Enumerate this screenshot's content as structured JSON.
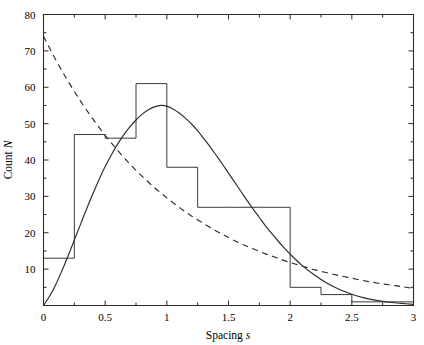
{
  "chart_data": {
    "type": "bar",
    "title": "",
    "xlabel": "Spacing s",
    "ylabel": "Count N",
    "xlim": [
      0,
      3
    ],
    "ylim": [
      0,
      80
    ],
    "grid": false,
    "legend": "none",
    "bin_width": 0.25,
    "bin_edges": [
      0,
      0.25,
      0.5,
      0.75,
      1,
      1.25,
      1.5,
      1.75,
      2,
      2.25,
      2.5,
      2.75,
      3
    ],
    "categories": [
      "0-0.25",
      "0.25-0.5",
      "0.5-0.75",
      "0.75-1",
      "1-1.25",
      "1.25-1.5",
      "1.5-1.75",
      "1.75-2",
      "2-2.25",
      "2.25-2.5",
      "2.5-2.75",
      "2.75-3"
    ],
    "values": [
      13,
      47,
      46,
      61,
      38,
      27,
      27,
      27,
      5,
      3,
      1,
      1
    ],
    "x_tick_values": [
      0,
      0.5,
      1,
      1.5,
      2,
      2.5,
      3
    ],
    "x_tick_labels": [
      "0",
      "0.5",
      "1",
      "1.5",
      "2",
      "2.5",
      "3"
    ],
    "x_minor_tick_values": [
      0.25,
      0.75,
      1.25,
      1.75,
      2.25,
      2.75
    ],
    "y_tick_values": [
      0,
      10,
      20,
      30,
      40,
      50,
      60,
      70,
      80
    ],
    "y_tick_labels": [
      "0",
      "10",
      "20",
      "30",
      "40",
      "50",
      "60",
      "70",
      "80"
    ],
    "series": [
      {
        "name": "wigner-surmise-curve",
        "style": "solid",
        "type": "line",
        "description": "Wigner surmise fit, rises from origin, peaks near s=0.85 at N=57.5, decays toward zero by s=3",
        "points": [
          [
            0.0,
            0.0
          ],
          [
            0.05,
            2.6
          ],
          [
            0.1,
            5.8
          ],
          [
            0.15,
            9.6
          ],
          [
            0.2,
            13.7
          ],
          [
            0.25,
            18.0
          ],
          [
            0.3,
            22.3
          ],
          [
            0.35,
            26.6
          ],
          [
            0.4,
            30.7
          ],
          [
            0.45,
            34.6
          ],
          [
            0.5,
            38.2
          ],
          [
            0.55,
            41.4
          ],
          [
            0.6,
            44.3
          ],
          [
            0.65,
            46.9
          ],
          [
            0.7,
            49.1
          ],
          [
            0.75,
            51.0
          ],
          [
            0.8,
            52.6
          ],
          [
            0.85,
            53.8
          ],
          [
            0.9,
            54.6
          ],
          [
            0.95,
            55.0
          ],
          [
            1.0,
            54.8
          ],
          [
            1.05,
            54.0
          ],
          [
            1.1,
            52.9
          ],
          [
            1.15,
            51.5
          ],
          [
            1.2,
            49.9
          ],
          [
            1.25,
            48.0
          ],
          [
            1.3,
            45.9
          ],
          [
            1.35,
            43.7
          ],
          [
            1.4,
            41.3
          ],
          [
            1.45,
            38.9
          ],
          [
            1.5,
            36.4
          ],
          [
            1.55,
            33.9
          ],
          [
            1.6,
            31.4
          ],
          [
            1.65,
            28.9
          ],
          [
            1.7,
            26.5
          ],
          [
            1.75,
            24.2
          ],
          [
            1.8,
            21.9
          ],
          [
            1.85,
            19.8
          ],
          [
            1.9,
            17.8
          ],
          [
            1.95,
            15.9
          ],
          [
            2.0,
            14.1
          ],
          [
            2.1,
            10.9
          ],
          [
            2.2,
            8.3
          ],
          [
            2.3,
            6.1
          ],
          [
            2.4,
            4.4
          ],
          [
            2.5,
            3.1
          ],
          [
            2.6,
            2.1
          ],
          [
            2.7,
            1.4
          ],
          [
            2.8,
            0.9
          ],
          [
            2.9,
            0.6
          ],
          [
            3.0,
            0.3
          ]
        ]
      },
      {
        "name": "poisson-exponential-curve",
        "style": "dashed",
        "type": "line",
        "description": "Poisson (exponential) distribution, starts at N=74 at s=0 and decays monotonically to about N=4 at s=3",
        "points": [
          [
            0.0,
            74.0
          ],
          [
            0.1,
            67.5
          ],
          [
            0.2,
            61.6
          ],
          [
            0.3,
            56.2
          ],
          [
            0.4,
            51.3
          ],
          [
            0.5,
            46.8
          ],
          [
            0.6,
            42.7
          ],
          [
            0.7,
            38.9
          ],
          [
            0.8,
            35.5
          ],
          [
            0.9,
            32.4
          ],
          [
            1.0,
            29.6
          ],
          [
            1.1,
            27.0
          ],
          [
            1.2,
            24.6
          ],
          [
            1.3,
            22.5
          ],
          [
            1.4,
            20.5
          ],
          [
            1.5,
            18.7
          ],
          [
            1.6,
            17.0
          ],
          [
            1.7,
            15.6
          ],
          [
            1.8,
            14.2
          ],
          [
            1.9,
            13.0
          ],
          [
            2.0,
            11.8
          ],
          [
            2.1,
            10.8
          ],
          [
            2.2,
            9.8
          ],
          [
            2.3,
            9.0
          ],
          [
            2.4,
            8.2
          ],
          [
            2.5,
            7.5
          ],
          [
            2.6,
            6.8
          ],
          [
            2.7,
            6.2
          ],
          [
            2.8,
            5.7
          ],
          [
            2.9,
            5.2
          ],
          [
            3.0,
            4.7
          ]
        ]
      }
    ]
  },
  "colors": {
    "axis": "#2b2b2b",
    "histogram": "#3a3a3a",
    "curve_solid": "#2b2b2b",
    "curve_dashed": "#2b2b2b",
    "background": "#ffffff"
  }
}
